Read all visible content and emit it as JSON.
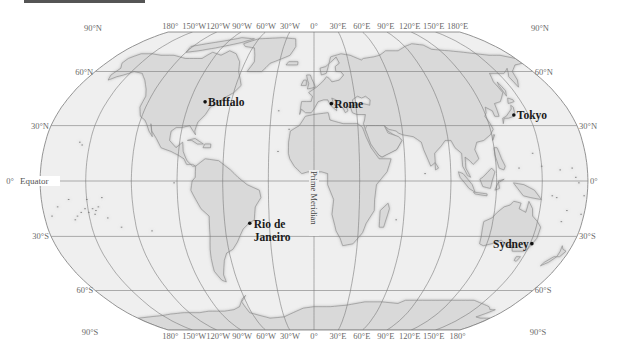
{
  "map": {
    "projection": "Robinson",
    "colors": {
      "ocean": "#efefef",
      "land": "#d9d9d9",
      "coast": "#8a8a8a",
      "graticule": "#7a7a7a",
      "header_bar": "#555555",
      "city_dot": "#111111"
    },
    "top_labels": [
      {
        "text": "90°N",
        "lon": null,
        "x": 93
      },
      {
        "text": "180°",
        "lon": -180
      },
      {
        "text": "150°W",
        "lon": -150
      },
      {
        "text": "120°W",
        "lon": -120
      },
      {
        "text": "90°W",
        "lon": -90
      },
      {
        "text": "60°W",
        "lon": -60
      },
      {
        "text": "30°W",
        "lon": -30
      },
      {
        "text": "0°",
        "lon": 0
      },
      {
        "text": "30°E",
        "lon": 30
      },
      {
        "text": "60°E",
        "lon": 60
      },
      {
        "text": "90°E",
        "lon": 90
      },
      {
        "text": "120°E",
        "lon": 120
      },
      {
        "text": "150°E",
        "lon": 150
      },
      {
        "text": "180°E",
        "lon": 180
      },
      {
        "text": "90°N",
        "lon": null,
        "x": 540
      }
    ],
    "bottom_labels": [
      {
        "text": "90°S",
        "lon": null,
        "x": 90
      },
      {
        "text": "180°",
        "lon": -180
      },
      {
        "text": "150°W",
        "lon": -150
      },
      {
        "text": "120°W",
        "lon": -120
      },
      {
        "text": "90°W",
        "lon": -90
      },
      {
        "text": "60°W",
        "lon": -60
      },
      {
        "text": "30°W",
        "lon": -30
      },
      {
        "text": "0°",
        "lon": 0
      },
      {
        "text": "30°E",
        "lon": 30
      },
      {
        "text": "60°E",
        "lon": 60
      },
      {
        "text": "90°E",
        "lon": 90
      },
      {
        "text": "120°E",
        "lon": 120
      },
      {
        "text": "150°E",
        "lon": 150
      },
      {
        "text": "180°",
        "lon": 180
      },
      {
        "text": "90°S",
        "lon": null,
        "x": 538
      }
    ],
    "left_labels": [
      {
        "text": "60°N",
        "lat": 60
      },
      {
        "text": "30°N",
        "lat": 30
      },
      {
        "text": "0°",
        "lat": 0
      },
      {
        "text": "30°S",
        "lat": -30
      },
      {
        "text": "60°S",
        "lat": -60
      }
    ],
    "right_labels": [
      {
        "text": "60°N",
        "lat": 60
      },
      {
        "text": "30°N",
        "lat": 30
      },
      {
        "text": "0°",
        "lat": 0
      },
      {
        "text": "30°S",
        "lat": -30
      },
      {
        "text": "60°S",
        "lat": -60
      }
    ],
    "equator_label": "Equator",
    "prime_meridian_label": "Prime Meridian",
    "cities": [
      {
        "name": "Buffalo",
        "lat": 42.9,
        "lon": -78.9
      },
      {
        "name": "Rome",
        "lat": 41.9,
        "lon": 12.5
      },
      {
        "name": "Tokyo",
        "lat": 35.7,
        "lon": 139.7
      },
      {
        "name": "Rio de",
        "name2": "Janeiro",
        "lat": -22.9,
        "lon": -43.2
      },
      {
        "name": "Sydney",
        "lat": -33.9,
        "lon": 151.2,
        "align": "left"
      }
    ]
  }
}
